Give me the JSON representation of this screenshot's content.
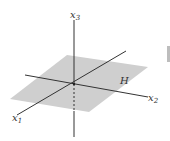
{
  "figure": {
    "axes": [
      {
        "name": "x1",
        "label": "x",
        "subscript": "1"
      },
      {
        "name": "x2",
        "label": "x",
        "subscript": "2"
      },
      {
        "name": "x3",
        "label": "x",
        "subscript": "3"
      }
    ],
    "plane_label": "H",
    "colors": {
      "plane": "#cfcfcf",
      "axis": "#333333",
      "side_bar": "#bdbdbd"
    }
  }
}
